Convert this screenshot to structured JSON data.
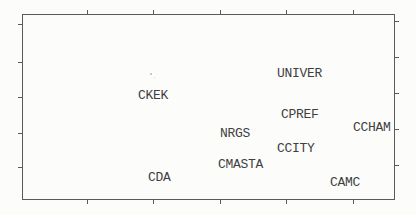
{
  "figure": {
    "background": "#fcfcfb",
    "text_color": "#3f3f3f",
    "font_size": 13,
    "frame": {
      "left": 22,
      "top": 14,
      "width": 373,
      "height": 186,
      "color": "#5a5a5a"
    },
    "ticks": {
      "length": 4,
      "thickness": 1,
      "top_x": [
        87,
        153,
        220,
        286,
        353
      ],
      "bottom_x": [
        87,
        153,
        220,
        286,
        353
      ],
      "left_y": [
        24,
        62,
        97,
        133,
        167
      ],
      "right_y": [
        21,
        57,
        93,
        129,
        165
      ]
    },
    "labels": [
      {
        "text": "UNIVER",
        "left": 277,
        "top": 67
      },
      {
        "text": "CKEK",
        "left": 138,
        "top": 89
      },
      {
        "text": "CPREF",
        "left": 281,
        "top": 108
      },
      {
        "text": "NRGS",
        "left": 220,
        "top": 127
      },
      {
        "text": "CCHAM",
        "left": 353,
        "top": 121
      },
      {
        "text": "CCITY",
        "left": 277,
        "top": 142
      },
      {
        "text": "CMASTA",
        "left": 218,
        "top": 158
      },
      {
        "text": "CDA",
        "left": 148,
        "top": 171
      },
      {
        "text": "CAMC",
        "left": 330,
        "top": 176
      }
    ],
    "specks": [
      {
        "left": 150,
        "top": 73,
        "size": 2,
        "color": "#b9b9b9"
      },
      {
        "left": 154,
        "top": 77,
        "size": 1,
        "color": "#cccccc"
      }
    ]
  },
  "chart_data": {
    "type": "scatter",
    "title": "",
    "xlabel": "",
    "ylabel": "",
    "legend": "none",
    "grid": false,
    "axes": {
      "tick_labels_visible": false,
      "x_tick_count": 5,
      "y_tick_count": 5,
      "ticks_point_outward": true
    },
    "points": [
      {
        "label": "UNIVER",
        "x": 0.748,
        "y": 0.683
      },
      {
        "label": "CKEK",
        "x": 0.351,
        "y": 0.565
      },
      {
        "label": "CPREF",
        "x": 0.749,
        "y": 0.462
      },
      {
        "label": "NRGS",
        "x": 0.571,
        "y": 0.36
      },
      {
        "label": "CCHAM",
        "x": 0.937,
        "y": 0.392
      },
      {
        "label": "CCITY",
        "x": 0.732,
        "y": 0.28
      },
      {
        "label": "CMASTA",
        "x": 0.59,
        "y": 0.194
      },
      {
        "label": "CDA",
        "x": 0.367,
        "y": 0.124
      },
      {
        "label": "CAMC",
        "x": 0.869,
        "y": 0.091
      }
    ]
  }
}
